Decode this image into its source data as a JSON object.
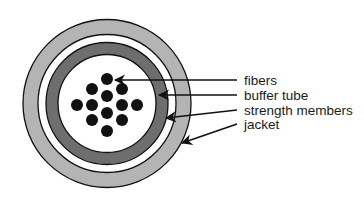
{
  "diagram": {
    "type": "fiber-optic-cable-cross-section",
    "colors": {
      "jacket": "#b4b4b4",
      "gap": "#ffffff",
      "buffer_tube": "#6e6e6e",
      "core": "#ffffff",
      "fiber": "#111111",
      "outline": "#111111"
    },
    "labels": [
      {
        "id": "fibers",
        "text": "fibers"
      },
      {
        "id": "buffer_tube",
        "text": "buffer tube"
      },
      {
        "id": "strength_members",
        "text": "strength members"
      },
      {
        "id": "jacket",
        "text": "jacket"
      }
    ],
    "fiber_count": 13
  }
}
